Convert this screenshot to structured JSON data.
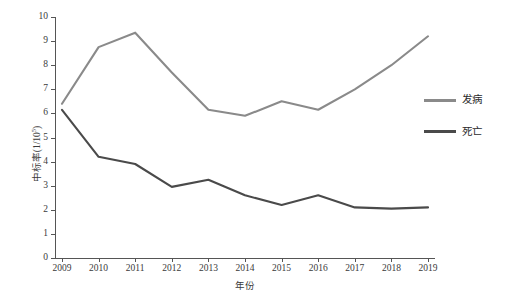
{
  "chart_data": {
    "type": "line",
    "title": "",
    "xlabel": "年份",
    "ylabel": "中标率(1/10",
    "ylabel_sup": "5",
    "ylabel_tail": ")",
    "categories": [
      "2009",
      "2010",
      "2011",
      "2012",
      "2013",
      "2014",
      "2015",
      "2016",
      "2017",
      "2018",
      "2019"
    ],
    "x": [
      2009,
      2010,
      2011,
      2012,
      2013,
      2014,
      2015,
      2016,
      2017,
      2018,
      2019
    ],
    "xlim": [
      2009,
      2019
    ],
    "ylim": [
      0,
      10
    ],
    "ytick_labels": [
      "0",
      "1",
      "2",
      "3",
      "4",
      "5",
      "6",
      "7",
      "8",
      "9",
      "10"
    ],
    "yticks": [
      0,
      1,
      2,
      3,
      4,
      5,
      6,
      7,
      8,
      9,
      10
    ],
    "grid": false,
    "legend_position": "right",
    "series": [
      {
        "name": "发病",
        "color": "#8a8a8a",
        "values": [
          6.4,
          8.75,
          9.35,
          7.7,
          6.15,
          5.9,
          6.5,
          6.15,
          7.0,
          8.0,
          9.2
        ]
      },
      {
        "name": "死亡",
        "color": "#4a4a4a",
        "values": [
          6.15,
          4.2,
          3.9,
          2.95,
          3.25,
          2.6,
          2.2,
          2.6,
          2.1,
          2.05,
          2.1
        ]
      }
    ]
  },
  "legend": {
    "items": [
      {
        "label": "发病",
        "color": "#8a8a8a"
      },
      {
        "label": "死亡",
        "color": "#4a4a4a"
      }
    ]
  },
  "axes": {
    "x_title": "年份",
    "y_title_main": "中标率(1/10",
    "y_title_sup": "5",
    "y_title_tail": ")"
  }
}
